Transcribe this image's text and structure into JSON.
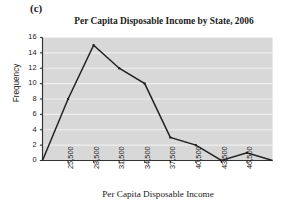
{
  "panel": {
    "label": "(c)"
  },
  "chart_data": {
    "type": "line",
    "title": "Per Capita Disposable Income by State, 2006",
    "xlabel": "Per Capita Disposable Income",
    "ylabel": "Frequency",
    "categories": [
      "22,500",
      "25,500",
      "28,500",
      "31,500",
      "34,500",
      "37,500",
      "40,500",
      "43,500",
      "46,500",
      "49,500"
    ],
    "x_tick_labels": [
      "25,500",
      "28,500",
      "31,500",
      "34,500",
      "37,500",
      "40,500",
      "43,500",
      "46,500"
    ],
    "y_tick_labels": [
      "0",
      "2",
      "4",
      "6",
      "8",
      "10",
      "12",
      "14",
      "16"
    ],
    "values": [
      0,
      8,
      15,
      12,
      10,
      3,
      2,
      0,
      1,
      0
    ],
    "xlim": [
      22500,
      49500
    ],
    "ylim": [
      0,
      16
    ],
    "grid": "horizontal",
    "legend": "none",
    "plot_background": "#d8d8d8",
    "gridline_color": "#eeeeee",
    "line_color": "#222222",
    "marker": "square"
  }
}
